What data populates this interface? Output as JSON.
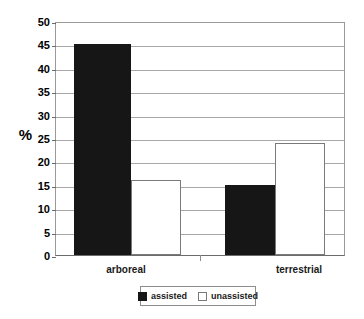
{
  "chart_data": {
    "type": "bar",
    "title": "",
    "subtitle": "",
    "xlabel": "",
    "ylabel": "%",
    "categories": [
      "arboreal",
      "terrestrial"
    ],
    "series": [
      {
        "name": "assisted",
        "values": [
          45,
          15
        ],
        "color": "#161616",
        "fill": "solid-black"
      },
      {
        "name": "unassisted",
        "values": [
          16,
          24
        ],
        "color": "#ffffff",
        "fill": "white-outlined"
      }
    ],
    "ylim": [
      0,
      50
    ],
    "ytick_step": 5,
    "yticks": [
      "50",
      "45",
      "40",
      "35",
      "30",
      "25",
      "20",
      "15",
      "10",
      "5",
      "0"
    ],
    "ytick_values": [
      50,
      45,
      40,
      35,
      30,
      25,
      20,
      15,
      10,
      5,
      0
    ],
    "grid": "horizontal",
    "legend_position": "bottom-center",
    "legend_entries": [
      "assisted",
      "unassisted"
    ],
    "background": "#ffffff",
    "axis_color": "#6b6b6b",
    "grid_color": "#a8a8a8"
  },
  "axis": {
    "y_title": "%"
  },
  "legend": {
    "items": [
      {
        "label": "assisted"
      },
      {
        "label": "unassisted"
      }
    ]
  }
}
